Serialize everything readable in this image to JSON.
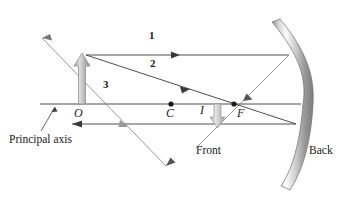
{
  "figure": {
    "background_color": "#ffffff",
    "line_color": "#3a3a3a",
    "ray_color": "#8c8c8c",
    "object_arrow_color": "#b3b3b3",
    "mirror_colors": {
      "light": "#fdfdfd",
      "mid": "#c9c9c9",
      "dark": "#8f8f8f",
      "edge": "#6e6e6e"
    }
  },
  "labels": {
    "ray1": "1",
    "ray2": "2",
    "ray3": "3",
    "object_point": "O",
    "center_of_curvature": "C",
    "image_point": "I",
    "focal_point": "F",
    "principal_axis": "Principal axis",
    "front": "Front",
    "back": "Back"
  },
  "geometry": {
    "principal_axis": {
      "x1": 40,
      "y1": 104,
      "x2": 300,
      "y2": 104
    },
    "object": {
      "base_x": 82,
      "base_y": 104,
      "tip_y": 55
    },
    "image": {
      "base_x": 217,
      "base_y": 104,
      "tip_y": 126
    },
    "points": {
      "O": {
        "x": 82,
        "y": 104
      },
      "C": {
        "x": 171,
        "y": 104
      },
      "F": {
        "x": 234,
        "y": 104
      },
      "I": {
        "x": 217,
        "y": 126
      }
    },
    "mirror": {
      "top": {
        "x": 272,
        "y": 22
      },
      "mid": {
        "x": 303,
        "y": 104
      },
      "bottom": {
        "x": 281,
        "y": 186
      },
      "thickness": 9
    },
    "ray1": {
      "incident": {
        "x1": 86,
        "y1": 55,
        "x2": 289,
        "y2": 55
      },
      "reflected": {
        "x1": 289,
        "y1": 55,
        "x2": 196,
        "y2": 148
      }
    },
    "ray2": {
      "incident": {
        "x1": 86,
        "y1": 55,
        "x2": 296,
        "y2": 124
      },
      "reflected": {
        "x1": 296,
        "y1": 124,
        "x2": 72,
        "y2": 124
      }
    },
    "ray3": {
      "upper_extension": {
        "x1": 86,
        "y1": 55,
        "x2": 42,
        "y2": 38
      },
      "main": {
        "x1": 86,
        "y1": 55,
        "x2": 166,
        "y2": 166
      }
    },
    "leader_line": {
      "x1": 40,
      "y1": 130,
      "x2": 56,
      "y2": 106
    }
  },
  "label_positions": {
    "ray1": {
      "x": 152,
      "y": 34
    },
    "ray2": {
      "x": 152,
      "y": 62
    },
    "ray3": {
      "x": 105,
      "y": 82
    },
    "O": {
      "x": 77,
      "y": 110
    },
    "C": {
      "x": 167,
      "y": 110
    },
    "I": {
      "x": 200,
      "y": 107
    },
    "F": {
      "x": 237,
      "y": 110
    },
    "principal_axis": {
      "x": 10,
      "y": 138
    },
    "front": {
      "x": 196,
      "y": 148
    },
    "back": {
      "x": 310,
      "y": 147
    }
  }
}
